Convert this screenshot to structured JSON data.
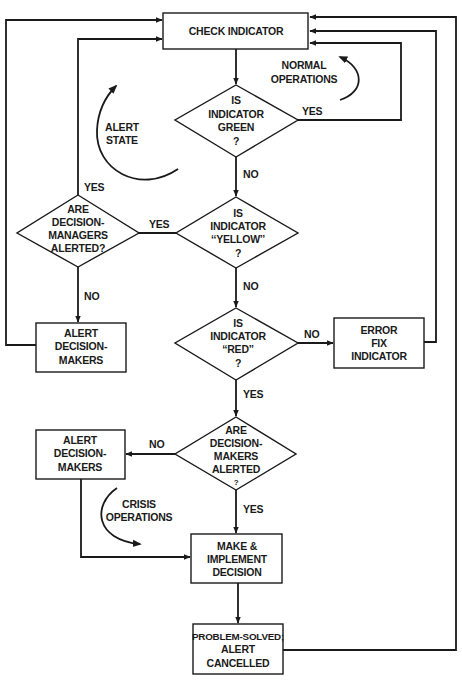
{
  "diagram": {
    "type": "flowchart",
    "nodes": {
      "check_indicator": {
        "lines": [
          "CHECK INDICATOR"
        ]
      },
      "is_green": {
        "lines": [
          "IS",
          "INDICATOR",
          "GREEN",
          "?"
        ]
      },
      "is_yellow": {
        "lines": [
          "IS",
          "INDICATOR",
          "‘‘YELLOW’’",
          "?"
        ]
      },
      "are_managers_alerted": {
        "lines": [
          "ARE",
          "DECISION-",
          "MANAGERS",
          "ALERTED?"
        ]
      },
      "alert_decision_makers_1": {
        "lines": [
          "ALERT",
          "DECISION-",
          "MAKERS"
        ]
      },
      "is_red": {
        "lines": [
          "IS",
          "INDICATOR",
          "‘‘RED’’",
          "?"
        ]
      },
      "error_fix": {
        "lines": [
          "ERROR",
          "FIX",
          "INDICATOR"
        ]
      },
      "are_makers_alerted": {
        "lines": [
          "ARE",
          "DECISION-",
          "MAKERS",
          "ALERTED",
          "?"
        ]
      },
      "alert_decision_makers_2": {
        "lines": [
          "ALERT",
          "DECISION-",
          "MAKERS"
        ]
      },
      "make_implement": {
        "lines": [
          "MAKE &",
          "IMPLEMENT",
          "DECISION"
        ]
      },
      "problem_solved": {
        "lines": [
          "PROBLEM-SOLVED;",
          "ALERT",
          "CANCELLED"
        ]
      }
    },
    "edge_labels": {
      "green_yes": "YES",
      "green_no": "NO",
      "yellow_yes": "YES",
      "yellow_no": "NO",
      "managers_yes": "YES",
      "managers_no": "NO",
      "red_no": "NO",
      "red_yes": "YES",
      "makers_no": "NO",
      "makers_yes": "YES"
    },
    "annotations": {
      "normal_operations": [
        "NORMAL",
        "OPERATIONS"
      ],
      "alert_state": [
        "ALERT",
        "STATE"
      ],
      "crisis_operations": [
        "CRISIS",
        "OPERATIONS"
      ]
    },
    "colors": {
      "ink": "#1a1a1a",
      "background": "#ffffff"
    }
  }
}
